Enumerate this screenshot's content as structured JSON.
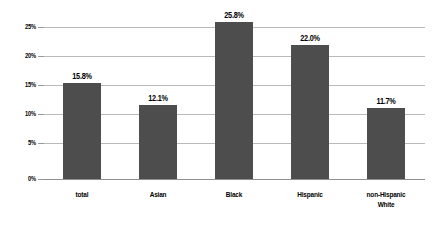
{
  "chart_data": {
    "type": "bar",
    "title": "",
    "subtitle": "",
    "xlabel": "",
    "ylabel": "",
    "categories": [
      "total",
      "Asian",
      "Black",
      "Hispanic",
      "non-Hispanic White"
    ],
    "category_lines": [
      [
        "total"
      ],
      [
        "Asian"
      ],
      [
        "Black"
      ],
      [
        "Hispanic"
      ],
      [
        "non-Hispanic",
        "White"
      ]
    ],
    "values": [
      15.8,
      12.1,
      25.8,
      22.0,
      11.7
    ],
    "value_labels": [
      "15.8%",
      "12.1%",
      "25.8%",
      "22.0%",
      "11.7%"
    ],
    "ylim": [
      0,
      25
    ],
    "yticks": [
      0,
      5,
      10,
      15,
      20,
      25
    ],
    "ytick_labels": [
      "0%",
      "5%",
      "10%",
      "15%",
      "20%",
      "25%"
    ],
    "grid": true,
    "legend": "none",
    "bar_color": "#4d4d4d",
    "gridline_color": "#b9b9b9",
    "axis_color": "#8f8f8f",
    "background_color": "#ffffff"
  }
}
